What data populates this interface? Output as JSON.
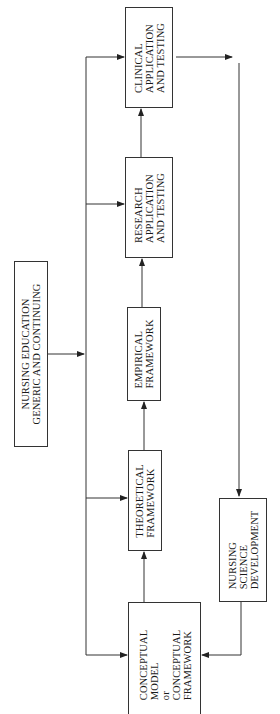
{
  "diagram": {
    "orientation": "rotated-90-ccw",
    "nodes": {
      "nursing_education": {
        "label": "NURSING EDUCATION\nGENERIC AND CONTINUING"
      },
      "conceptual": {
        "label": "CONCEPTUAL\nMODEL\nor\nCONCEPTUAL\nFRAMEWORK"
      },
      "theoretical": {
        "label": "THEORETICAL\nFRAMEWORK"
      },
      "empirical": {
        "label": "EMPIRICAL\nFRAMEWORK"
      },
      "research": {
        "label": "RESEARCH\nAPPLICATION\nAND TESTING"
      },
      "clinical": {
        "label": "CLINICAL\nAPPLICATION\nAND TESTING"
      },
      "science_dev": {
        "label": "NURSING\nSCIENCE\nDEVELOPMENT"
      }
    },
    "edges": [
      {
        "from": "nursing_education",
        "to": "conceptual"
      },
      {
        "from": "nursing_education",
        "to": "theoretical"
      },
      {
        "from": "nursing_education",
        "to": "empirical"
      },
      {
        "from": "nursing_education",
        "to": "research"
      },
      {
        "from": "nursing_education",
        "to": "clinical"
      },
      {
        "from": "conceptual",
        "to": "theoretical"
      },
      {
        "from": "theoretical",
        "to": "empirical"
      },
      {
        "from": "empirical",
        "to": "research"
      },
      {
        "from": "research",
        "to": "clinical"
      },
      {
        "from": "clinical",
        "to": "science_dev"
      },
      {
        "from": "science_dev",
        "to": "conceptual"
      }
    ],
    "colors": {
      "line": "#333333",
      "background": "#ffffff"
    }
  }
}
